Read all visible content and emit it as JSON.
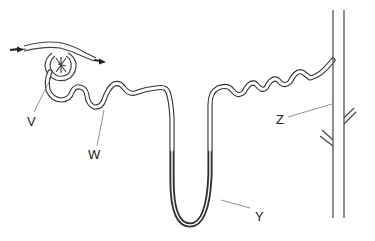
{
  "diagram": {
    "labels": {
      "V": "V",
      "W": "W",
      "Y": "Y",
      "Z": "Z"
    },
    "colors": {
      "line": "#333333",
      "pointer": "#777777",
      "background": "#ffffff"
    }
  }
}
